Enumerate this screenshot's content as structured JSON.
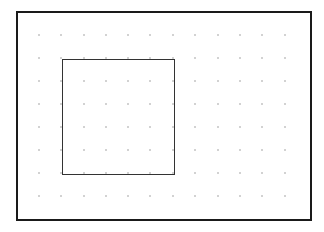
{
  "canvas": {
    "width": 324,
    "height": 232,
    "background": "#ffffff"
  },
  "frame": {
    "x": 17,
    "y": 12,
    "width": 294,
    "height": 208,
    "stroke": "#1a1a1a",
    "stroke_width": 2
  },
  "grid": {
    "dot_color": "#9a9a9a",
    "dot_radius": 0.8,
    "columns": [
      39,
      61,
      84,
      106,
      128,
      150,
      173,
      195,
      218,
      240,
      262,
      285
    ],
    "rows": [
      35,
      58,
      81,
      104,
      127,
      150,
      173,
      196
    ]
  },
  "selection_rect": {
    "x": 62,
    "y": 59,
    "width": 112,
    "height": 115,
    "stroke": "#333333",
    "stroke_width": 1
  }
}
